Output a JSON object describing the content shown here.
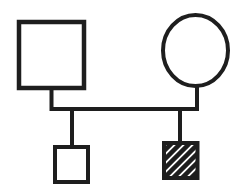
{
  "diagram": {
    "type": "pedigree",
    "background_color": "#ffffff",
    "stroke_color": "#1e1e1e",
    "hatch_color": "#1e1e1e",
    "nodes": [
      {
        "id": "parent-left",
        "shape": "square",
        "size": "large",
        "fill": "open",
        "position": "top-left"
      },
      {
        "id": "parent-right",
        "shape": "circle",
        "size": "large",
        "fill": "open",
        "position": "top-right"
      },
      {
        "id": "child-left",
        "shape": "square",
        "size": "small",
        "fill": "open",
        "position": "bottom-left"
      },
      {
        "id": "child-right",
        "shape": "square",
        "size": "small",
        "fill": "hatched",
        "position": "bottom-right"
      }
    ],
    "connectors": [
      {
        "id": "couple-line",
        "connects": [
          "parent-left",
          "parent-right"
        ]
      },
      {
        "id": "child-drop-left",
        "connects": [
          "couple-line",
          "child-left"
        ]
      },
      {
        "id": "child-drop-right",
        "connects": [
          "couple-line",
          "child-right"
        ]
      }
    ]
  }
}
